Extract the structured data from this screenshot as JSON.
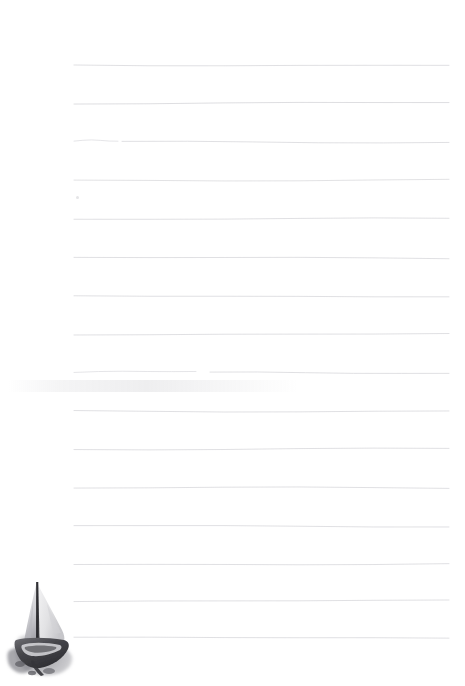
{
  "document": {
    "kind": "lined-notepaper",
    "title": "Blank ruled notepaper with sailboat illustration",
    "background_color": "#ffffff",
    "width": 465,
    "height": 686,
    "body_text": ""
  },
  "rules": {
    "label": "Ruled writing lines",
    "count": 17,
    "color": "#d6d6da",
    "stroke_width": 0.9,
    "x_start": 74,
    "x_end": 449,
    "spacing": 38,
    "y_positions": [
      65,
      103,
      141,
      180,
      219,
      258,
      296,
      334,
      372,
      411,
      449,
      488,
      526,
      564,
      601,
      638,
      675
    ],
    "segments": [
      {
        "y": 65,
        "x1": 74,
        "x2": 449,
        "opacity": 0.85
      },
      {
        "y": 103,
        "x1": 74,
        "x2": 449,
        "opacity": 0.9
      },
      {
        "y": 141,
        "x1": 74,
        "x2": 118,
        "opacity": 0.7
      },
      {
        "y": 142,
        "x1": 122,
        "x2": 449,
        "opacity": 0.85
      },
      {
        "y": 180,
        "x1": 74,
        "x2": 449,
        "opacity": 0.8
      },
      {
        "y": 219,
        "x1": 74,
        "x2": 449,
        "opacity": 0.85
      },
      {
        "y": 258,
        "x1": 74,
        "x2": 449,
        "opacity": 0.85
      },
      {
        "y": 296,
        "x1": 74,
        "x2": 449,
        "opacity": 0.85
      },
      {
        "y": 334,
        "x1": 74,
        "x2": 449,
        "opacity": 0.85
      },
      {
        "y": 372,
        "x1": 74,
        "x2": 196,
        "opacity": 0.7
      },
      {
        "y": 373,
        "x1": 210,
        "x2": 449,
        "opacity": 0.85
      },
      {
        "y": 411,
        "x1": 74,
        "x2": 449,
        "opacity": 0.85
      },
      {
        "y": 449,
        "x1": 74,
        "x2": 449,
        "opacity": 0.85
      },
      {
        "y": 488,
        "x1": 74,
        "x2": 449,
        "opacity": 0.85
      },
      {
        "y": 526,
        "x1": 74,
        "x2": 449,
        "opacity": 0.85
      },
      {
        "y": 564,
        "x1": 74,
        "x2": 449,
        "opacity": 0.85
      },
      {
        "y": 601,
        "x1": 74,
        "x2": 449,
        "opacity": 0.85
      },
      {
        "y": 638,
        "x1": 74,
        "x2": 449,
        "opacity": 0.85
      }
    ]
  },
  "marks": {
    "speck": {
      "label": "ink speck",
      "x": 76,
      "y": 196,
      "size": 3,
      "color": "#cfcfd4"
    },
    "smudge": {
      "label": "faint paper smudge",
      "x": 8,
      "y": 380,
      "width": 290,
      "height": 12
    }
  },
  "illustration": {
    "name": "sailboat",
    "label": "Grayscale sailboat illustration",
    "style": "ink-and-wash monochrome",
    "position": {
      "x": 2,
      "y": 576,
      "width": 80,
      "height": 104
    },
    "palette": {
      "mast": "#3d3d41",
      "hull_dark": "#4a4a4e",
      "hull_mid": "#7b7b80",
      "sail_light": "#ececed",
      "sail_shadow": "#c9c9cd",
      "wash": "#9a9aa0"
    },
    "parts": {
      "mast": "mast",
      "mainsail": "mainsail",
      "jib": "jib",
      "hull": "hull",
      "water_wash": "water-wash"
    }
  }
}
